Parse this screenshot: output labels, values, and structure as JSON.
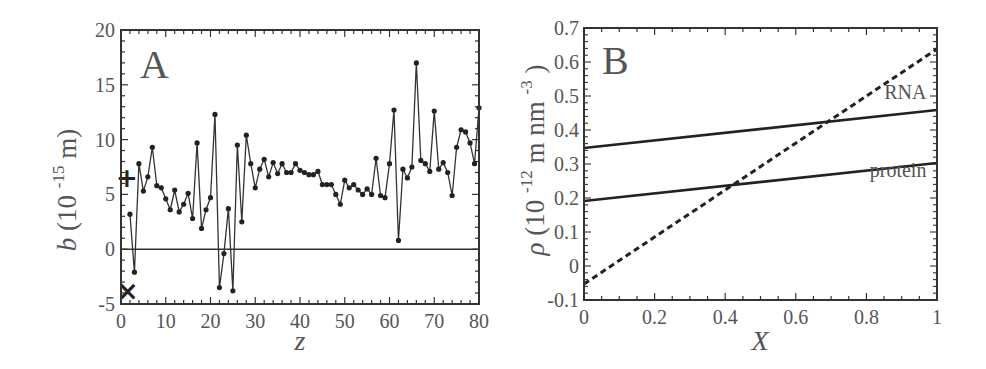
{
  "chart_data": [
    {
      "panel": "A",
      "type": "line",
      "title": "",
      "xlabel": "z",
      "ylabel": "b (10^-15 m)",
      "ylabel_parts": {
        "symbol": "b",
        "paren_open": "(10",
        "exponent": "-15",
        "unit": " m)"
      },
      "xlim": [
        0,
        80
      ],
      "ylim": [
        -5,
        20
      ],
      "xticks": [
        0,
        10,
        20,
        30,
        40,
        50,
        60,
        70,
        80
      ],
      "yticks": [
        -5,
        0,
        5,
        10,
        15,
        20
      ],
      "grid": false,
      "reference_line": {
        "y": 0
      },
      "markers": [
        {
          "symbol": "+",
          "z": 1.3,
          "b": 6.5
        },
        {
          "symbol": "×",
          "z": 1.5,
          "b": -3.8
        }
      ],
      "series": [
        {
          "name": "b(z)",
          "style": "line-with-dots",
          "x": [
            2,
            3,
            4,
            5,
            6,
            7,
            8,
            9,
            10,
            11,
            12,
            13,
            14,
            15,
            16,
            17,
            18,
            19,
            20,
            21,
            22,
            23,
            24,
            25,
            26,
            27,
            28,
            29,
            30,
            31,
            32,
            33,
            34,
            35,
            36,
            37,
            38,
            39,
            40,
            41,
            42,
            43,
            44,
            45,
            46,
            47,
            48,
            49,
            50,
            51,
            52,
            53,
            54,
            55,
            56,
            57,
            58,
            59,
            60,
            61,
            62,
            63,
            64,
            65,
            66,
            67,
            68,
            69,
            70,
            71,
            72,
            73,
            74,
            75,
            76,
            77,
            78,
            79,
            80
          ],
          "values": [
            3.2,
            -2.1,
            7.8,
            5.3,
            6.6,
            9.3,
            5.8,
            5.6,
            4.6,
            3.6,
            5.4,
            3.4,
            4.1,
            5.1,
            2.8,
            9.7,
            1.9,
            3.6,
            4.7,
            12.3,
            -3.5,
            -0.4,
            3.7,
            -3.8,
            9.5,
            2.5,
            10.4,
            7.8,
            5.6,
            7.3,
            8.2,
            6.6,
            7.9,
            6.9,
            7.8,
            7.0,
            7.0,
            7.8,
            7.2,
            7.0,
            6.8,
            6.8,
            7.1,
            5.9,
            5.9,
            5.9,
            5.0,
            4.1,
            6.3,
            5.6,
            5.9,
            5.4,
            5.0,
            5.5,
            5.0,
            8.3,
            4.9,
            4.7,
            7.8,
            12.7,
            0.8,
            7.3,
            6.5,
            7.5,
            17.0,
            8.1,
            7.8,
            7.1,
            12.6,
            7.3,
            7.9,
            7.0,
            4.9,
            9.3,
            10.9,
            10.7,
            9.7,
            7.8,
            12.9
          ]
        }
      ]
    },
    {
      "panel": "B",
      "type": "line",
      "title": "",
      "xlabel": "X",
      "ylabel": "ρ (10^-12 m nm^-3)",
      "ylabel_parts": {
        "symbol": "ρ",
        "paren_open": "(10",
        "exponent": "-12",
        "unit": " m nm",
        "unit_exponent": "-3",
        "close": ")"
      },
      "xlim": [
        0,
        1
      ],
      "ylim": [
        -0.1,
        0.7
      ],
      "xticks": [
        0,
        0.2,
        0.4,
        0.6,
        0.8,
        1
      ],
      "xtick_labels": [
        "0",
        "0.2",
        "0.4",
        "0.6",
        "0.8",
        "1"
      ],
      "yticks": [
        -0.1,
        0,
        0.1,
        0.2,
        0.3,
        0.4,
        0.5,
        0.6,
        0.7
      ],
      "ytick_labels": [
        "-0.1",
        "0",
        "0.1",
        "0.2",
        "0.3",
        "0.4",
        "0.5",
        "0.6",
        "0.7"
      ],
      "grid": false,
      "series": [
        {
          "name": "RNA",
          "style": "solid",
          "x": [
            0,
            1
          ],
          "values": [
            0.347,
            0.459
          ]
        },
        {
          "name": "protein",
          "style": "solid",
          "x": [
            0,
            1
          ],
          "values": [
            0.191,
            0.303
          ]
        },
        {
          "name": "solvent",
          "style": "dashed",
          "x": [
            0,
            1
          ],
          "values": [
            -0.053,
            0.638
          ]
        }
      ],
      "annotations": [
        {
          "text": "RNA",
          "x": 0.97,
          "y": 0.49
        },
        {
          "text": "protein",
          "x": 0.97,
          "y": 0.262
        }
      ]
    }
  ],
  "panels": {
    "a": {
      "letter": "A"
    },
    "b": {
      "letter": "B"
    }
  }
}
